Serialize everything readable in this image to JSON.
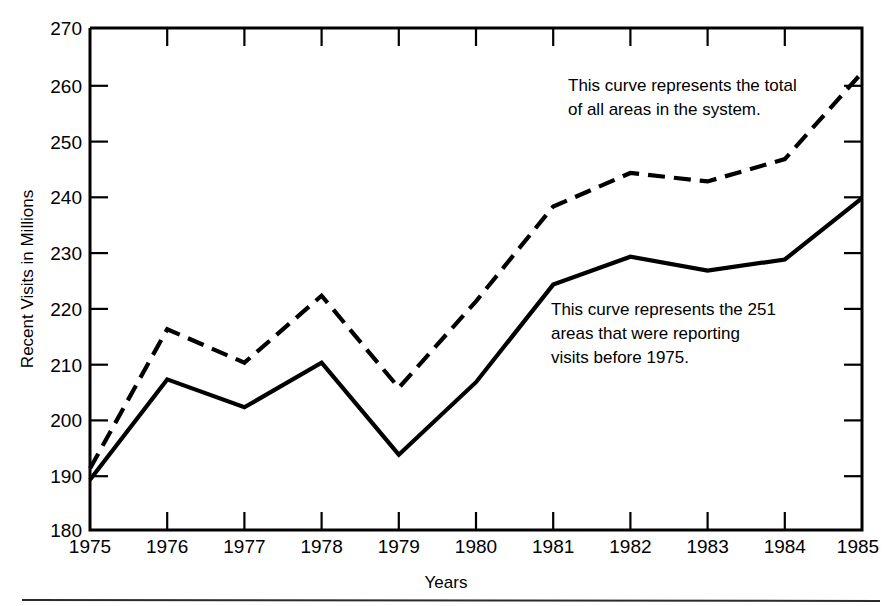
{
  "chart_data": {
    "type": "line",
    "title": "",
    "xlabel": "Years",
    "ylabel": "Recent Visits in Millions",
    "x": [
      1975,
      1976,
      1977,
      1978,
      1979,
      1980,
      1981,
      1982,
      1983,
      1984,
      1985
    ],
    "xtick_labels": [
      "1975",
      "1976",
      "1977",
      "1978",
      "1979",
      "1980",
      "1981",
      "1982",
      "1983",
      "1984",
      "1985"
    ],
    "ytick_labels": [
      "180",
      "190",
      "200",
      "210",
      "220",
      "230",
      "240",
      "250",
      "260",
      "270"
    ],
    "yticks": [
      180,
      190,
      200,
      210,
      220,
      230,
      240,
      250,
      260,
      270
    ],
    "ylim": [
      180,
      270
    ],
    "xlim": [
      1975,
      1985
    ],
    "grid": false,
    "legend": "none",
    "series": [
      {
        "name": "Total of all areas in the system",
        "style": "dashed",
        "color": "#000000",
        "values": [
          191,
          216,
          210,
          222,
          205.5,
          221,
          238,
          244,
          242.5,
          246.5,
          262
        ]
      },
      {
        "name": "251 areas reporting visits before 1975",
        "style": "solid",
        "color": "#000000",
        "values": [
          189,
          207,
          202,
          210,
          193.5,
          206.5,
          224,
          229,
          226.5,
          228.5,
          239.5
        ]
      }
    ],
    "annotations": [
      {
        "id": "total-curve-note",
        "line1": "This curve represents the total",
        "line2": "of all areas in the system.",
        "line3": ""
      },
      {
        "id": "reporting-areas-note",
        "line1": "This curve represents the 251",
        "line2": "areas that were reporting",
        "line3": "visits before 1975."
      }
    ]
  },
  "figure": {
    "background": "#ffffff",
    "ink": "#000000"
  }
}
